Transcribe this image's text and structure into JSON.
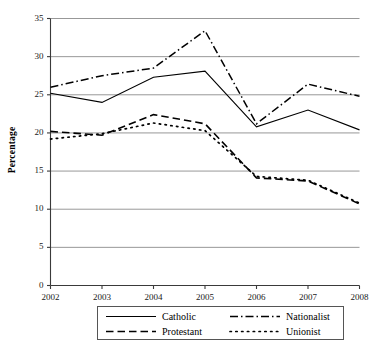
{
  "chart_data": {
    "type": "line",
    "title": "",
    "xlabel": "",
    "ylabel": "Percentage",
    "categories": [
      "2002",
      "2003",
      "2004",
      "2005",
      "2006",
      "2007",
      "2008"
    ],
    "x": [
      2002,
      2003,
      2004,
      2005,
      2006,
      2007,
      2008
    ],
    "xlim": [
      2002,
      2008
    ],
    "ylim": [
      0,
      35
    ],
    "yticks": [
      0,
      5,
      10,
      15,
      20,
      25,
      30,
      35
    ],
    "ytick_labels": [
      "0",
      "5",
      "10",
      "15",
      "20",
      "25",
      "30",
      "35"
    ],
    "xtick_labels": [
      "2002",
      "2003",
      "2004",
      "2005",
      "2006",
      "2007",
      "2008"
    ],
    "grid": "horizontal",
    "legend_position": "below-axes",
    "series": [
      {
        "name": "Catholic",
        "style": "solid",
        "color": "#000000",
        "values": [
          25.2,
          24.0,
          27.3,
          28.1,
          20.8,
          23.0,
          20.4
        ]
      },
      {
        "name": "Nationalist",
        "style": "dash-dot",
        "color": "#000000",
        "values": [
          26.0,
          27.5,
          28.5,
          33.4,
          21.2,
          26.4,
          24.8
        ]
      },
      {
        "name": "Protestant",
        "style": "dashed",
        "color": "#000000",
        "values": [
          20.2,
          19.7,
          22.4,
          21.2,
          14.1,
          13.7,
          10.7
        ]
      },
      {
        "name": "Unionist",
        "style": "dotted",
        "color": "#000000",
        "values": [
          19.2,
          19.9,
          21.3,
          20.3,
          14.3,
          13.8,
          10.8
        ]
      }
    ]
  },
  "axes": {
    "ylabel": "Percentage",
    "ytick_labels": [
      "35",
      "30",
      "25",
      "20",
      "15",
      "10",
      "5",
      "0"
    ],
    "xtick_labels": [
      "2002",
      "2003",
      "2004",
      "2005",
      "2006",
      "2007",
      "2008"
    ]
  },
  "legend": {
    "entries": [
      {
        "label": "Catholic",
        "style": "solid"
      },
      {
        "label": "Nationalist",
        "style": "dash-dot"
      },
      {
        "label": "Protestant",
        "style": "dashed"
      },
      {
        "label": "Unionist",
        "style": "dotted"
      }
    ]
  },
  "colors": {
    "line": "#000000",
    "grid": "#8c8c8c",
    "axis": "#3a3a3a",
    "background": "#ffffff"
  }
}
